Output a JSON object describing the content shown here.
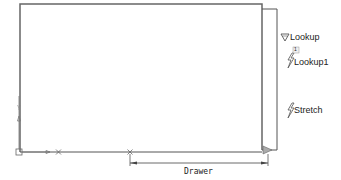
{
  "drawing": {
    "colors": {
      "line": "#555555",
      "frame": "#666666",
      "grip": "#888888",
      "text": "#222222"
    },
    "dimension": {
      "label": "Drawer"
    },
    "parameters": [
      {
        "name": "Lookup",
        "icon": "lookup-triangle-icon"
      },
      {
        "name": "Lookup1",
        "icon": "lightning-icon",
        "badge": "1"
      },
      {
        "name": "Stretch",
        "icon": "lightning-icon"
      }
    ],
    "ucs": {
      "y_label": "Y"
    }
  }
}
